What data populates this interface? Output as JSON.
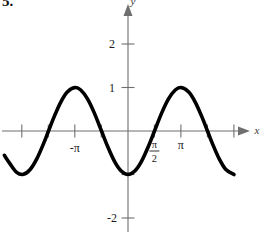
{
  "problem": {
    "number_label": "5."
  },
  "figure": {
    "name": "trigonometric-graph",
    "x_axis_name": "x",
    "y_axis_name": "y"
  },
  "chart_data": {
    "type": "line",
    "title": "",
    "subtitle": "",
    "xlabel": "x",
    "ylabel": "y",
    "function": "y = -cos(x)",
    "amplitude": 1,
    "period": 6.2832,
    "period_label": "2π",
    "xlim": [
      -7.33,
      8.38
    ],
    "ylim": [
      -2.6,
      2.75
    ],
    "grid": false,
    "legend": null,
    "x_tick_labels": [
      "-π",
      "π/2",
      "π"
    ],
    "x_ticks": [
      {
        "value": -4.712,
        "label": ""
      },
      {
        "value": -3.927,
        "label": ""
      },
      {
        "value": -3.142,
        "label": "-π"
      },
      {
        "value": -1.571,
        "label": ""
      },
      {
        "value": 1.571,
        "label": "π/2"
      },
      {
        "value": 3.142,
        "label": "π"
      },
      {
        "value": 4.712,
        "label": ""
      },
      {
        "value": 6.283,
        "label": ""
      }
    ],
    "y_tick_labels": [
      "2",
      "1",
      "-2"
    ],
    "y_ticks": [
      {
        "value": 2,
        "label": "2"
      },
      {
        "value": 1,
        "label": "1"
      },
      {
        "value": -1,
        "label": ""
      },
      {
        "value": -2,
        "label": "-2"
      }
    ],
    "key_points": [
      {
        "x": -3.142,
        "y": 1,
        "kind": "maximum"
      },
      {
        "x": -1.571,
        "y": 0,
        "kind": "zero"
      },
      {
        "x": 0,
        "y": -1,
        "kind": "minimum"
      },
      {
        "x": 1.571,
        "y": 0,
        "kind": "zero"
      },
      {
        "x": 3.142,
        "y": 1,
        "kind": "maximum"
      },
      {
        "x": 4.712,
        "y": 0,
        "kind": "zero"
      },
      {
        "x": 6.283,
        "y": -1,
        "kind": "minimum"
      }
    ],
    "x": [
      -7.33,
      -7.0,
      -6.6,
      -6.2,
      -5.8,
      -5.4,
      -5.0,
      -4.712,
      -4.4,
      -4.0,
      -3.6,
      -3.142,
      -2.8,
      -2.4,
      -2.0,
      -1.571,
      -1.2,
      -0.8,
      -0.4,
      0,
      0.4,
      0.8,
      1.2,
      1.571,
      2.0,
      2.4,
      2.8,
      3.142,
      3.6,
      4.0,
      4.4,
      4.712,
      5.0,
      5.4,
      5.8,
      6.283,
      6.7,
      7.1,
      7.5,
      7.9,
      8.2
    ],
    "y": [
      -0.56,
      -0.75,
      -0.95,
      -0.996,
      -0.885,
      -0.635,
      -0.284,
      0,
      0.307,
      0.654,
      0.896,
      1,
      0.942,
      0.737,
      0.416,
      0,
      -0.362,
      -0.697,
      -0.921,
      -1,
      -0.921,
      -0.697,
      -0.362,
      0,
      0.416,
      0.737,
      0.942,
      1,
      0.896,
      0.654,
      0.307,
      0,
      -0.284,
      -0.635,
      -0.885,
      -1,
      -0.914,
      -0.672,
      -0.346,
      0.045,
      0.39
    ],
    "series": [
      {
        "name": "y = -cos(x)",
        "expression": "-cos(x)",
        "color": "#000000",
        "line_width": 3.6
      }
    ],
    "axis_color": "#6f6f6f",
    "curve_color": "#000000"
  }
}
